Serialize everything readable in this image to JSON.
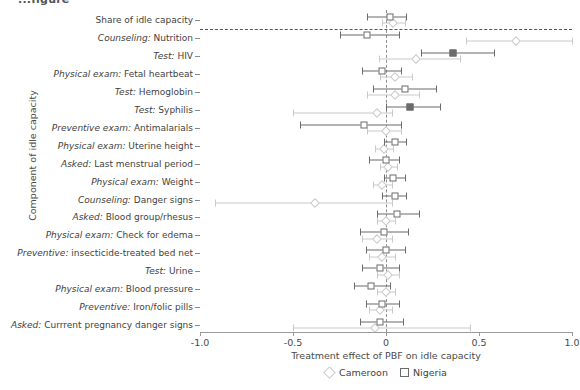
{
  "clipped_title": "...figure",
  "axes": {
    "ylabel": "Component of idle capacity",
    "xlabel": "Treatment effect of PBF on idle capacity",
    "xticks": [
      "-1.0",
      "-0.5",
      "0",
      "0.5",
      "1.0"
    ],
    "xtick_values": [
      -1.0,
      -0.5,
      0,
      0.5,
      1.0
    ],
    "xlim": [
      -1.0,
      1.0
    ]
  },
  "legend": {
    "position": "bottom-center",
    "entries": [
      {
        "label": "Cameroon",
        "marker": "diamond",
        "color": "#c9c9c9"
      },
      {
        "label": "Nigeria",
        "marker": "square",
        "color": "#6b6b6b"
      }
    ]
  },
  "chart_data": {
    "type": "scatter",
    "subtype": "forest-plot",
    "title": "",
    "xlabel": "Treatment effect of PBF on idle capacity",
    "ylabel": "Component of idle capacity",
    "xlim": [
      -1.0,
      1.0
    ],
    "grid": false,
    "reference_line_x": 0,
    "separator_after_category": 0,
    "categories": [
      {
        "prefix": "",
        "text": "Share of idle capacity"
      },
      {
        "prefix": "Counseling:",
        "text": " Nutrition"
      },
      {
        "prefix": "Test:",
        "text": " HIV"
      },
      {
        "prefix": "Physical exam:",
        "text": " Fetal heartbeat"
      },
      {
        "prefix": "Test:",
        "text": " Hemoglobin"
      },
      {
        "prefix": "Test:",
        "text": " Syphilis"
      },
      {
        "prefix": "Preventive exam:",
        "text": " Antimalarials"
      },
      {
        "prefix": "Physical exam:",
        "text": " Uterine height"
      },
      {
        "prefix": "Asked:",
        "text": " Last menstrual period"
      },
      {
        "prefix": "Physical exam:",
        "text": " Weight"
      },
      {
        "prefix": "Counseling:",
        "text": " Danger signs"
      },
      {
        "prefix": "Asked:",
        "text": " Blood group/rhesus"
      },
      {
        "prefix": "Physical exam:",
        "text": " Check for edema"
      },
      {
        "prefix": "Preventive:",
        "text": " insecticide-treated bed net"
      },
      {
        "prefix": "Test:",
        "text": " Urine"
      },
      {
        "prefix": "Physical exam:",
        "text": " Blood pressure"
      },
      {
        "prefix": "Preventive:",
        "text": " Iron/folic pills"
      },
      {
        "prefix": "Asked:",
        "text": " Currrent pregnancy danger signs"
      }
    ],
    "series": [
      {
        "name": "Nigeria",
        "marker": "square",
        "color": "#6b6b6b",
        "points": [
          {
            "category": "Share of idle capacity",
            "estimate": 0.02,
            "low": -0.1,
            "high": 0.11,
            "filled": false
          },
          {
            "category": "Counseling: Nutrition",
            "estimate": -0.1,
            "low": -0.25,
            "high": 0.07,
            "filled": false
          },
          {
            "category": "Test: HIV",
            "estimate": 0.36,
            "low": 0.19,
            "high": 0.58,
            "filled": true
          },
          {
            "category": "Physical exam: Fetal heartbeat",
            "estimate": -0.02,
            "low": -0.13,
            "high": 0.08,
            "filled": false
          },
          {
            "category": "Test: Hemoglobin",
            "estimate": 0.1,
            "low": -0.07,
            "high": 0.27,
            "filled": false
          },
          {
            "category": "Test: Syphilis",
            "estimate": 0.13,
            "low": 0.0,
            "high": 0.29,
            "filled": true
          },
          {
            "category": "Preventive exam: Antimalarials",
            "estimate": -0.12,
            "low": -0.46,
            "high": 0.08,
            "filled": false
          },
          {
            "category": "Physical exam: Uterine height",
            "estimate": 0.05,
            "low": -0.01,
            "high": 0.11,
            "filled": false
          },
          {
            "category": "Asked: Last menstrual period",
            "estimate": 0.0,
            "low": -0.09,
            "high": 0.07,
            "filled": false
          },
          {
            "category": "Physical exam: Weight",
            "estimate": 0.04,
            "low": -0.01,
            "high": 0.1,
            "filled": false
          },
          {
            "category": "Counseling: Danger signs",
            "estimate": 0.05,
            "low": -0.02,
            "high": 0.11,
            "filled": false
          },
          {
            "category": "Asked: Blood group/rhesus",
            "estimate": 0.06,
            "low": -0.05,
            "high": 0.18,
            "filled": false
          },
          {
            "category": "Physical exam: Check for edema",
            "estimate": -0.01,
            "low": -0.14,
            "high": 0.12,
            "filled": false
          },
          {
            "category": "Preventive: insecticide-treated bed net",
            "estimate": 0.0,
            "low": -0.11,
            "high": 0.1,
            "filled": false
          },
          {
            "category": "Test: Urine",
            "estimate": -0.03,
            "low": -0.13,
            "high": 0.07,
            "filled": false
          },
          {
            "category": "Physical exam: Blood pressure",
            "estimate": -0.08,
            "low": -0.17,
            "high": 0.02,
            "filled": false
          },
          {
            "category": "Preventive: Iron/folic pills",
            "estimate": -0.02,
            "low": -0.11,
            "high": 0.07,
            "filled": false
          },
          {
            "category": "Asked: Currrent pregnancy danger signs",
            "estimate": -0.03,
            "low": -0.14,
            "high": 0.09,
            "filled": false
          }
        ]
      },
      {
        "name": "Cameroon",
        "marker": "diamond",
        "color": "#c9c9c9",
        "points": [
          {
            "category": "Share of idle capacity",
            "estimate": 0.04,
            "low": -0.02,
            "high": 0.1,
            "filled": false
          },
          {
            "category": "Counseling: Nutrition",
            "estimate": 0.7,
            "low": 0.43,
            "high": 1.0,
            "filled": false
          },
          {
            "category": "Test: HIV",
            "estimate": 0.16,
            "low": -0.04,
            "high": 0.4,
            "filled": false
          },
          {
            "category": "Physical exam: Fetal heartbeat",
            "estimate": 0.05,
            "low": -0.03,
            "high": 0.14,
            "filled": false
          },
          {
            "category": "Test: Hemoglobin",
            "estimate": 0.05,
            "low": -0.1,
            "high": 0.18,
            "filled": false
          },
          {
            "category": "Test: Syphilis",
            "estimate": -0.05,
            "low": -0.5,
            "high": 0.03,
            "filled": false
          },
          {
            "category": "Preventive exam: Antimalarials",
            "estimate": 0.0,
            "low": -0.1,
            "high": 0.08,
            "filled": false
          },
          {
            "category": "Physical exam: Uterine height",
            "estimate": -0.01,
            "low": -0.06,
            "high": 0.04,
            "filled": false
          },
          {
            "category": "Asked: Last menstrual period",
            "estimate": 0.01,
            "low": -0.03,
            "high": 0.06,
            "filled": false
          },
          {
            "category": "Physical exam: Weight",
            "estimate": -0.02,
            "low": -0.07,
            "high": 0.03,
            "filled": false
          },
          {
            "category": "Counseling: Danger signs",
            "estimate": -0.38,
            "low": -0.92,
            "high": 0.03,
            "filled": false
          },
          {
            "category": "Asked: Blood group/rhesus",
            "estimate": 0.0,
            "low": -0.05,
            "high": 0.05,
            "filled": false
          },
          {
            "category": "Physical exam: Check for edema",
            "estimate": -0.05,
            "low": -0.13,
            "high": 0.03,
            "filled": false
          },
          {
            "category": "Preventive: insecticide-treated bed net",
            "estimate": -0.02,
            "low": -0.09,
            "high": 0.05,
            "filled": false
          },
          {
            "category": "Test: Urine",
            "estimate": 0.01,
            "low": -0.05,
            "high": 0.07,
            "filled": false
          },
          {
            "category": "Physical exam: Blood pressure",
            "estimate": 0.0,
            "low": -0.05,
            "high": 0.05,
            "filled": false
          },
          {
            "category": "Preventive: Iron/folic pills",
            "estimate": -0.03,
            "low": -0.09,
            "high": 0.03,
            "filled": false
          },
          {
            "category": "Asked: Currrent pregnancy danger signs",
            "estimate": -0.06,
            "low": -0.5,
            "high": 0.45,
            "filled": false
          }
        ]
      }
    ]
  }
}
